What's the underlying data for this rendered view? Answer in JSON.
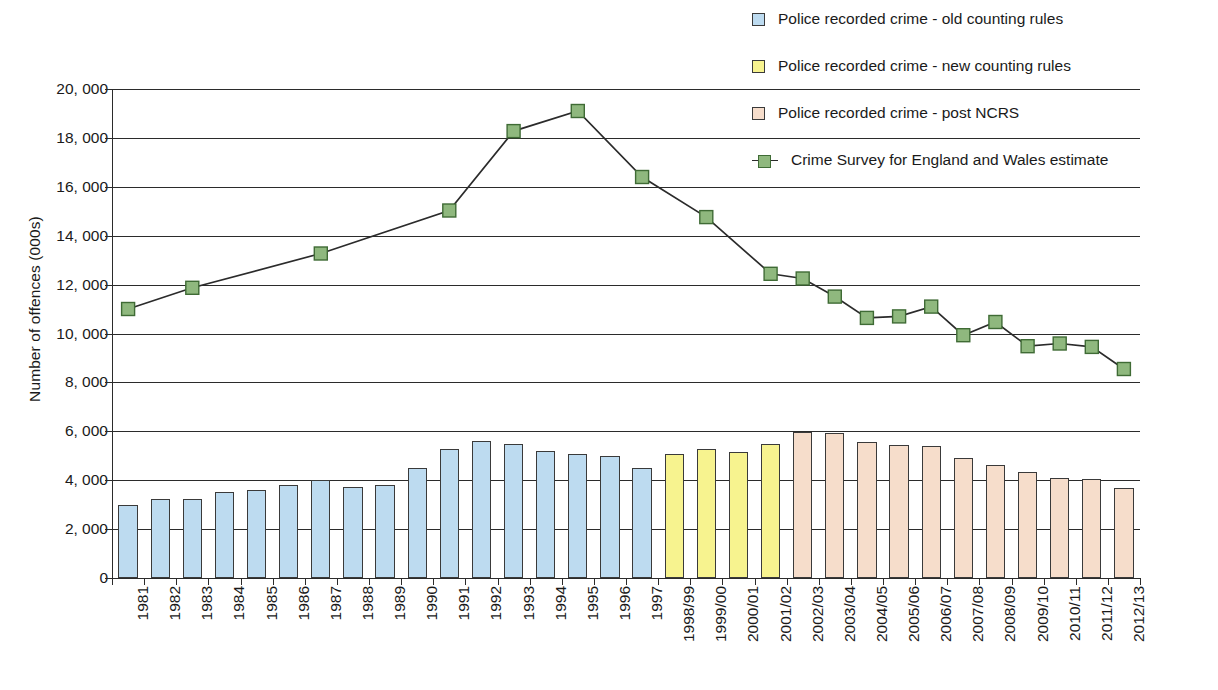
{
  "chart_data": {
    "type": "bar",
    "title": "",
    "xlabel": "",
    "ylabel": "Number of offences (000s)",
    "ylim": [
      0,
      20000
    ],
    "ytick_labels": [
      "20, 000",
      "18, 000",
      "16, 000",
      "14, 000",
      "12, 000",
      "10, 000",
      "8, 000",
      "6, 000",
      "4, 000",
      "2, 000",
      "0"
    ],
    "ytick_values": [
      20000,
      18000,
      16000,
      14000,
      12000,
      10000,
      8000,
      6000,
      4000,
      2000,
      0
    ],
    "grid": true,
    "legend_position": "top-right",
    "categories": [
      "1981",
      "1982",
      "1983",
      "1984",
      "1985",
      "1986",
      "1987",
      "1988",
      "1989",
      "1990",
      "1991",
      "1992",
      "1993",
      "1994",
      "1995",
      "1996",
      "1997",
      "1998/99",
      "1999/00",
      "2000/01",
      "2001/02",
      "2002/03",
      "2003/04",
      "2004/05",
      "2005/06",
      "2006/07",
      "2007/08",
      "2008/09",
      "2009/10",
      "2010/11",
      "2011/12",
      "2012/13"
    ],
    "series": [
      {
        "name": "Police recorded crime - old counting rules",
        "key": "old",
        "color": "#bddbf0",
        "type": "bar",
        "values": [
          2990,
          3220,
          3250,
          3500,
          3610,
          3790,
          3990,
          3720,
          3800,
          4520,
          5280,
          5620,
          5490,
          5190,
          5090,
          4990,
          4510,
          4430,
          null,
          null,
          null,
          null,
          null,
          null,
          null,
          null,
          null,
          null,
          null,
          null,
          null,
          null
        ]
      },
      {
        "name": "Police recorded crime - new counting rules",
        "key": "new",
        "color": "#f7f38f",
        "type": "bar",
        "values": [
          null,
          null,
          null,
          null,
          null,
          null,
          null,
          null,
          null,
          null,
          null,
          null,
          null,
          null,
          null,
          null,
          null,
          5090,
          5280,
          5150,
          5470,
          null,
          null,
          null,
          null,
          null,
          null,
          null,
          null,
          null,
          null,
          null
        ]
      },
      {
        "name": "Police recorded crime - post NCRS",
        "key": "ncrs",
        "color": "#f6ddcb",
        "type": "bar",
        "values": [
          null,
          null,
          null,
          null,
          null,
          null,
          null,
          null,
          null,
          null,
          null,
          null,
          null,
          null,
          null,
          null,
          null,
          null,
          null,
          null,
          null,
          5960,
          5950,
          5570,
          5430,
          5390,
          4900,
          4630,
          4320,
          4100,
          4030,
          3700
        ]
      },
      {
        "name": "Crime Survey for England and Wales estimate",
        "key": "csew",
        "color": "#8fb87e",
        "type": "line",
        "values": [
          11000,
          null,
          11870,
          null,
          null,
          null,
          13270,
          null,
          null,
          null,
          15030,
          null,
          18280,
          null,
          19100,
          null,
          16400,
          null,
          14760,
          null,
          12440,
          12250,
          11510,
          10640,
          10700,
          11100,
          9930,
          10470,
          9480,
          9590,
          9450,
          8550
        ]
      }
    ]
  },
  "legend": {
    "items": [
      {
        "label": "Police recorded crime - old counting rules",
        "marker": "swatch",
        "swatch_class": "sw-old"
      },
      {
        "label": "Police recorded crime - new counting rules",
        "marker": "swatch",
        "swatch_class": "sw-new"
      },
      {
        "label": "Police recorded crime - post NCRS",
        "marker": "swatch",
        "swatch_class": "sw-ncrs"
      },
      {
        "label": "Crime Survey for England and Wales estimate",
        "marker": "line",
        "swatch_class": "sw-csew"
      }
    ]
  },
  "colors": {
    "old_counting_rules": "#bddbf0",
    "new_counting_rules": "#f7f38f",
    "post_ncrs": "#f6ddcb",
    "csew_marker": "#8fb87e",
    "axis": "#2b2b2b",
    "background": "#ffffff"
  }
}
